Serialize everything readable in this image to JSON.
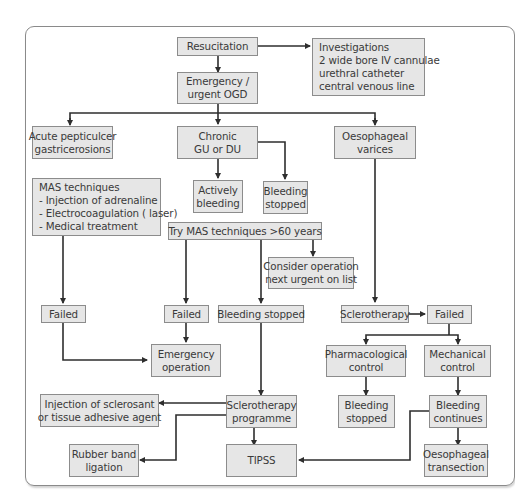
{
  "colors": {
    "box_fill": "#e6e6e6",
    "box_border": "#8c8c8c",
    "line": "#2e2e2e",
    "frame": "#8a8a8a",
    "text": "#3a3a3a"
  },
  "nodes": {
    "resuscitation": {
      "lines": [
        "Resucitation"
      ]
    },
    "investigations": {
      "lines": [
        "Investigations",
        "2 wide bore IV cannulae",
        "urethral catheter",
        "central venous line"
      ]
    },
    "emergency_ogd": {
      "lines": [
        "Emergency /",
        "urgent OGD"
      ]
    },
    "acute_peptic": {
      "lines": [
        "Acute pepticulcer",
        "gastricerosions"
      ]
    },
    "chronic_gu_du": {
      "lines": [
        "Chronic",
        "GU or DU"
      ]
    },
    "oesophageal_varices": {
      "lines": [
        "Oesophageal",
        "varices"
      ]
    },
    "mas_techniques": {
      "lines": [
        "MAS techniques",
        "- Injection of adrenaline",
        "- Electrocoagulation ( laser)",
        "- Medical treatment"
      ]
    },
    "actively_bleeding": {
      "lines": [
        "Actively",
        "bleeding"
      ]
    },
    "bleeding_stopped_1": {
      "lines": [
        "Bleeding",
        "stopped"
      ]
    },
    "try_mas": {
      "lines": [
        "Try MAS techniques >60 years"
      ]
    },
    "consider_operation": {
      "lines": [
        "Consider operation",
        "next urgent on list"
      ]
    },
    "failed_1": {
      "lines": [
        "Failed"
      ]
    },
    "failed_2": {
      "lines": [
        "Failed"
      ]
    },
    "bleeding_stopped_2": {
      "lines": [
        "Bleeding stopped"
      ]
    },
    "sclerotherapy": {
      "lines": [
        "Sclerotherapy"
      ]
    },
    "failed_3": {
      "lines": [
        "Failed"
      ]
    },
    "emergency_operation": {
      "lines": [
        "Emergency",
        "operation"
      ]
    },
    "pharmacological_control": {
      "lines": [
        "Pharmacological",
        "control"
      ]
    },
    "mechanical_control": {
      "lines": [
        "Mechanical",
        "control"
      ]
    },
    "injection_sclerosant": {
      "lines": [
        "Injection of sclerosant",
        "or tissue adhesive agent"
      ]
    },
    "sclerotherapy_programme": {
      "lines": [
        "Sclerotherapy",
        "programme"
      ]
    },
    "bleeding_stopped_3": {
      "lines": [
        "Bleeding",
        "stopped"
      ]
    },
    "bleeding_continues": {
      "lines": [
        "Bleeding",
        "continues"
      ]
    },
    "rubber_band": {
      "lines": [
        "Rubber band",
        "ligation"
      ]
    },
    "tipss": {
      "lines": [
        "TIPSS"
      ]
    },
    "oesophageal_transection": {
      "lines": [
        "Oesophageal",
        "transection"
      ]
    }
  }
}
